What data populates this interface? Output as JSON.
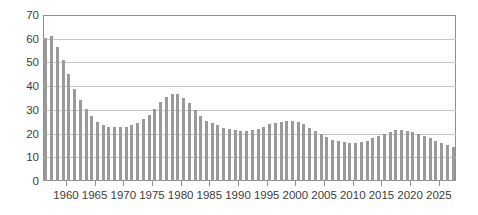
{
  "chart_data": {
    "type": "bar",
    "title": "",
    "xlabel": "",
    "ylabel": "",
    "x": [
      1956,
      1957,
      1958,
      1959,
      1960,
      1961,
      1962,
      1963,
      1964,
      1965,
      1966,
      1967,
      1968,
      1969,
      1970,
      1971,
      1972,
      1973,
      1974,
      1975,
      1976,
      1977,
      1978,
      1979,
      1980,
      1981,
      1982,
      1983,
      1984,
      1985,
      1986,
      1987,
      1988,
      1989,
      1990,
      1991,
      1992,
      1993,
      1994,
      1995,
      1996,
      1997,
      1998,
      1999,
      2000,
      2001,
      2002,
      2003,
      2004,
      2005,
      2006,
      2007,
      2008,
      2009,
      2010,
      2011,
      2012,
      2013,
      2014,
      2015,
      2016,
      2017,
      2018,
      2019,
      2020,
      2021,
      2022,
      2023,
      2024,
      2025,
      2026,
      2027
    ],
    "values": [
      60.5,
      61,
      56.5,
      51,
      45,
      39,
      34,
      30.5,
      27.5,
      25,
      23.5,
      23,
      23,
      23,
      23,
      23.5,
      24.5,
      26,
      28,
      30.5,
      33.5,
      35.5,
      36.5,
      36.5,
      35,
      33,
      30,
      27.5,
      25.5,
      24.5,
      23.5,
      22.5,
      22,
      21.5,
      21,
      21,
      21.5,
      22,
      23,
      24,
      24.5,
      25,
      25.5,
      25.5,
      25,
      24,
      22.5,
      21,
      20,
      18.5,
      17.5,
      17,
      16.5,
      16,
      16,
      16.5,
      17,
      18,
      19,
      20,
      20.5,
      21.5,
      21.5,
      21,
      20.5,
      20,
      19,
      18,
      17,
      16,
      15,
      14.5
    ],
    "ylim": [
      0,
      70
    ],
    "y_ticks": [
      0,
      10,
      20,
      30,
      40,
      50,
      60,
      70
    ],
    "x_tick_years": [
      1960,
      1965,
      1970,
      1975,
      1980,
      1985,
      1990,
      1995,
      2000,
      2005,
      2010,
      2015,
      2020,
      2025
    ],
    "x_tick_labels": [
      "1960",
      "1965",
      "1970",
      "1975",
      "1980",
      "1985",
      "1990",
      "1995",
      "2000",
      "2005",
      "2010",
      "2015",
      "2020",
      "2025"
    ],
    "y_tick_labels": [
      "0",
      "10",
      "20",
      "30",
      "40",
      "50",
      "60",
      "70"
    ],
    "grid": true,
    "legend": null,
    "bar_color": "#9a9a9a",
    "grid_color": "#c6c6c6",
    "frame_color": "#8f8f8f",
    "text_color": "#3c3c3c",
    "background_color": "#ffffff"
  }
}
